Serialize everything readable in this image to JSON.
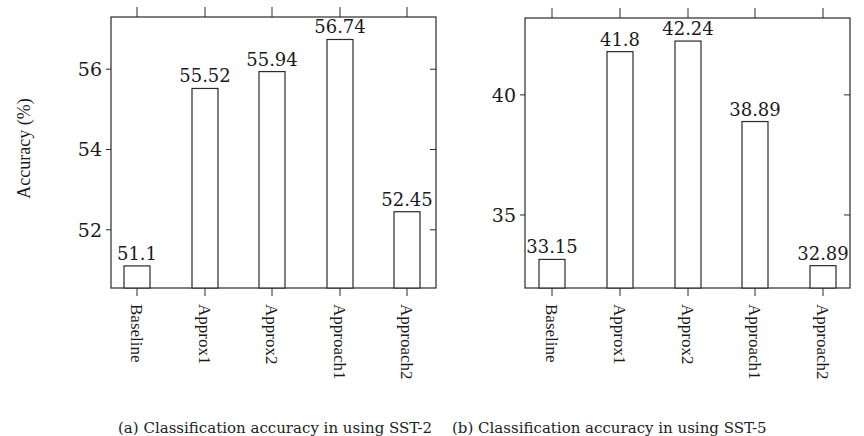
{
  "chart_data": [
    {
      "type": "bar",
      "title": "",
      "caption": "(a) Classification accuracy in using SST-2",
      "xlabel": "",
      "ylabel": "Accuracy (%)",
      "categories": [
        "Baseline",
        "Approx1",
        "Approx2",
        "Approach1",
        "Approach2"
      ],
      "values": [
        51.1,
        55.52,
        55.94,
        56.74,
        52.45
      ],
      "value_labels": [
        "51.1",
        "55.52",
        "55.94",
        "56.74",
        "52.45"
      ],
      "yticks": [
        52,
        54,
        56
      ],
      "ylim": [
        50.55,
        57.3
      ],
      "grid": false,
      "legend": null,
      "frame": {
        "x0": 111,
        "x1": 436,
        "y0": 17,
        "y1": 288
      },
      "tick_y_px": {
        "52": 230,
        "54": 150,
        "56": 69
      },
      "bar_centers_px": [
        137,
        205,
        272,
        340,
        407
      ],
      "bar_width_px": 26
    },
    {
      "type": "bar",
      "title": "",
      "caption": "(b) Classification accuracy in using SST-5",
      "xlabel": "",
      "ylabel": "",
      "categories": [
        "Baseline",
        "Approx1",
        "Approx2",
        "Approach1",
        "Approach2"
      ],
      "values": [
        33.15,
        41.8,
        42.24,
        38.89,
        32.89
      ],
      "value_labels": [
        "33.15",
        "41.8",
        "42.24",
        "38.89",
        "32.89"
      ],
      "yticks": [
        35,
        40
      ],
      "ylim": [
        31.96,
        43.2
      ],
      "grid": false,
      "legend": null,
      "frame": {
        "x0": 525,
        "x1": 850,
        "y0": 18,
        "y1": 288
      },
      "tick_y_px": {
        "35": 215,
        "40": 95
      },
      "bar_centers_px": [
        552,
        620,
        688,
        755,
        823
      ],
      "bar_width_px": 26
    }
  ],
  "colors": {
    "bar_fill": "#ffffff",
    "stroke": "#2a2a2a",
    "text": "#1a1a1a"
  }
}
